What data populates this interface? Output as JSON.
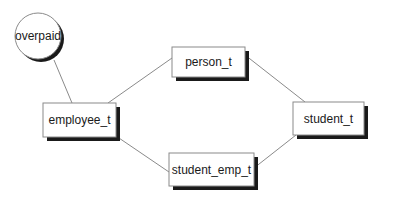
{
  "diagram": {
    "type": "type-hierarchy",
    "nodes": [
      {
        "id": "overpaid",
        "label": "overpaid",
        "shape": "circle",
        "cx": 38,
        "cy": 36,
        "r": 23
      },
      {
        "id": "person_t",
        "label": "person_t",
        "shape": "rect",
        "x": 172,
        "y": 47,
        "w": 73,
        "h": 30
      },
      {
        "id": "employee_t",
        "label": "employee_t",
        "shape": "rect",
        "x": 43,
        "y": 103,
        "w": 73,
        "h": 34
      },
      {
        "id": "student_t",
        "label": "student_t",
        "shape": "rect",
        "x": 293,
        "y": 102,
        "w": 71,
        "h": 33
      },
      {
        "id": "student_emp_t",
        "label": "student_emp_t",
        "shape": "rect",
        "x": 169,
        "y": 153,
        "w": 85,
        "h": 33
      }
    ],
    "edges": [
      {
        "from": "overpaid",
        "to": "employee_t",
        "x1": 54,
        "y1": 60,
        "x2": 72,
        "y2": 103
      },
      {
        "from": "employee_t",
        "to": "person_t",
        "x1": 108,
        "y1": 103,
        "x2": 172,
        "y2": 58
      },
      {
        "from": "person_t",
        "to": "student_t",
        "x1": 245,
        "y1": 55,
        "x2": 305,
        "y2": 102
      },
      {
        "from": "employee_t",
        "to": "student_emp_t",
        "x1": 116,
        "y1": 136,
        "x2": 169,
        "y2": 172
      },
      {
        "from": "student_emp_t",
        "to": "student_t",
        "x1": 254,
        "y1": 168,
        "x2": 296,
        "y2": 135
      }
    ],
    "colors": {
      "node_fill": "#ffffff",
      "node_stroke": "#8a8a8a",
      "shadow": "#1a1a1a",
      "edge": "#8a8a8a",
      "text": "#1a1a1a"
    }
  }
}
